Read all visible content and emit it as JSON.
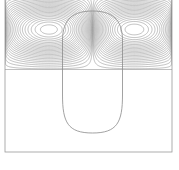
{
  "figure": {
    "title": "",
    "background_color": "#ffffff",
    "width": 179,
    "height": 170
  },
  "domain_frame": {
    "name": "computational-domain-border",
    "x": 5,
    "y": -6,
    "width": 167,
    "height": 158,
    "stroke_color": "#9a9a9a",
    "stroke_width": 0.8,
    "fill": "none"
  },
  "interface": {
    "name": "bubble-interface-contour",
    "label": "bubble interface",
    "center_x": 92.5,
    "center_y": 72,
    "half_width": 30,
    "top_y": 11,
    "bottom_y": 133,
    "stroke_color": "#8a8a8a",
    "stroke_width": 0.8,
    "fill": "none",
    "shape": "capsule-oval"
  },
  "chart_data": {
    "type": "line",
    "subtype": "contour",
    "title": "",
    "subtitle": "",
    "xlabel": "",
    "ylabel": "",
    "xlim": [
      5,
      172
    ],
    "ylim": [
      -6,
      152
    ],
    "grid": false,
    "legend": null,
    "axis_ticks": [],
    "tick_labels": [],
    "annotations": [],
    "series": [
      {
        "name": "streamfunction contours",
        "kind": "contour-field",
        "line_color": "#8c8c8c",
        "line_width": 0.55,
        "n_levels": 26
      }
    ],
    "vortices": [
      {
        "name": "left-vortex-core",
        "cx": 48,
        "cy": 32,
        "rotation": "clockwise",
        "core_rx": 9,
        "core_ry": 3.2,
        "tilt_deg": -12
      },
      {
        "name": "right-vortex-core",
        "cx": 137,
        "cy": 32,
        "rotation": "counter-clockwise",
        "core_rx": 9,
        "core_ry": 3.2,
        "tilt_deg": 12
      }
    ],
    "field_region": {
      "top": -6,
      "bottom": 70,
      "left": 5,
      "right": 172,
      "note": "contours confined to upper portion of domain; lower region quiescent"
    },
    "quiescent_region": {
      "top": 70,
      "bottom": 152,
      "fill": "#ffffff"
    }
  }
}
